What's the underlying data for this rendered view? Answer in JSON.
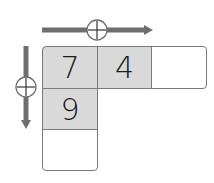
{
  "diagram": {
    "horizontal_operator": {
      "symbol": "+",
      "direction": "right"
    },
    "vertical_operator": {
      "symbol": "+",
      "direction": "down"
    },
    "cells": {
      "r0c0": "7",
      "r0c1": "4",
      "r0c2": "",
      "r1c0": "9",
      "r2c0": ""
    },
    "colors": {
      "filled_cell": "#d9d9d9",
      "border": "#7a7a7a",
      "arrow": "#6e6e6e"
    }
  }
}
